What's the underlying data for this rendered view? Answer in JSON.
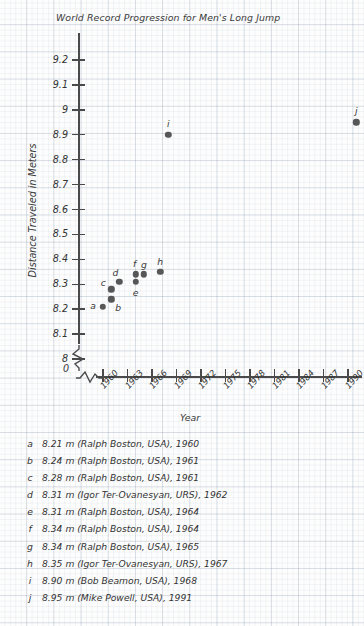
{
  "chart_data": {
    "type": "scatter",
    "title": "World Record Progression for Men's Long Jump",
    "xlabel": "Year",
    "ylabel": "Distance Traveled in Meters",
    "origin_label": "0",
    "xlim": [
      1959,
      1992
    ],
    "ylim": [
      7.95,
      9.25
    ],
    "grid": true,
    "axis_break_x": true,
    "axis_break_y": true,
    "legend_position": "below-plot",
    "yticks": [
      "9.2",
      "9.1",
      "9",
      "8.9",
      "8.8",
      "8.7",
      "8.6",
      "8.5",
      "8.4",
      "8.3",
      "8.2",
      "8.1",
      "8"
    ],
    "ytick_values": [
      9.2,
      9.1,
      9.0,
      8.9,
      8.8,
      8.7,
      8.6,
      8.5,
      8.4,
      8.3,
      8.2,
      8.1,
      8.0
    ],
    "xticks": [
      "1960",
      "1963",
      "1966",
      "1969",
      "1972",
      "1975",
      "1978",
      "1981",
      "1984",
      "1987",
      "1990"
    ],
    "xtick_values": [
      1960,
      1963,
      1966,
      1969,
      1972,
      1975,
      1978,
      1981,
      1984,
      1987,
      1990
    ],
    "point_color": "#575757",
    "points": [
      {
        "key": "a",
        "x": 1960,
        "y": 8.21,
        "label_dx": -10,
        "label_dy": -2
      },
      {
        "key": "b",
        "x": 1961,
        "y": 8.24,
        "label_dx": 7,
        "label_dy": 8
      },
      {
        "key": "c",
        "x": 1961,
        "y": 8.28,
        "label_dx": -8,
        "label_dy": -7
      },
      {
        "key": "d",
        "x": 1962,
        "y": 8.31,
        "label_dx": -4,
        "label_dy": -10
      },
      {
        "key": "e",
        "x": 1964,
        "y": 8.31,
        "label_dx": 0,
        "label_dy": 10
      },
      {
        "key": "f",
        "x": 1964,
        "y": 8.34,
        "label_dx": -1,
        "label_dy": -11
      },
      {
        "key": "g",
        "x": 1965,
        "y": 8.34,
        "label_dx": 0,
        "label_dy": -10
      },
      {
        "key": "h",
        "x": 1967,
        "y": 8.35,
        "label_dx": 0,
        "label_dy": -11
      },
      {
        "key": "i",
        "x": 1968,
        "y": 8.9,
        "label_dx": 0,
        "label_dy": -12
      },
      {
        "key": "j",
        "x": 1991,
        "y": 8.95,
        "label_dx": 0,
        "label_dy": -12
      }
    ],
    "legend": [
      {
        "key": "a",
        "text": "8.21 m (Ralph Boston, USA), 1960"
      },
      {
        "key": "b",
        "text": "8.24 m (Ralph Boston, USA), 1961"
      },
      {
        "key": "c",
        "text": "8.28 m (Ralph Boston, USA), 1961"
      },
      {
        "key": "d",
        "text": "8.31 m (Igor Ter-Ovanesyan, URS), 1962"
      },
      {
        "key": "e",
        "text": "8.31 m (Ralph Boston, USA), 1964"
      },
      {
        "key": "f",
        "text": "8.34 m (Ralph Boston, USA), 1964"
      },
      {
        "key": "g",
        "text": "8.34 m (Ralph Boston, USA), 1965"
      },
      {
        "key": "h",
        "text": "8.35 m (Igor Ter-Ovanesyan, URS), 1967"
      },
      {
        "key": "i",
        "text": "8.90 m (Bob Beamon, USA), 1968"
      },
      {
        "key": "j",
        "text": "8.95 m (Mike Powell, USA), 1991"
      }
    ]
  }
}
